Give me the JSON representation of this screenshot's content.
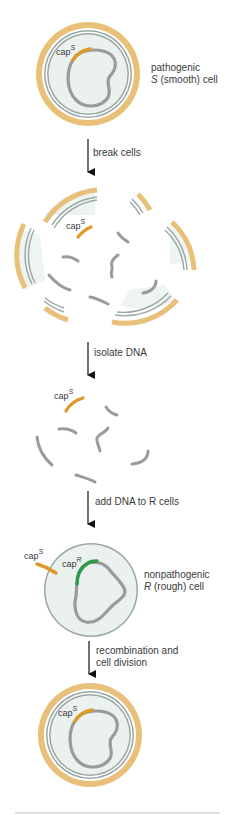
{
  "colors": {
    "capsule": "#e8c07a",
    "membrane": "#9aa8a4",
    "cytoplasm": "#eaf1ef",
    "dna": "#9b9b9b",
    "capS_gene": "#e0982a",
    "capR_gene": "#2e9a4a",
    "arrow": "#111111",
    "rule": "#bdbdbd"
  },
  "cells": {
    "s_cell": {
      "label_line1": "pathogenic",
      "label_line2_italic": "S",
      "label_line2_rest": " (smooth) cell",
      "gene_label": "cap",
      "gene_sup": "S"
    },
    "r_cell": {
      "label_line1": "nonpathogenic",
      "label_line2_italic": "R",
      "label_line2_rest": " (rough) cell",
      "gene_label": "cap",
      "gene_sup": "R"
    },
    "broken": {
      "gene_label": "cap",
      "gene_sup": "S"
    },
    "isolated": {
      "gene_label": "cap",
      "gene_sup": "S"
    },
    "added": {
      "gene_label": "cap",
      "gene_sup": "S"
    },
    "result": {
      "gene_label": "cap",
      "gene_sup": "S"
    }
  },
  "steps": [
    {
      "label": "break cells"
    },
    {
      "label": "isolate DNA"
    },
    {
      "label": "add DNA to R cells"
    },
    {
      "label_line1": "recombination and",
      "label_line2": "cell division"
    }
  ]
}
